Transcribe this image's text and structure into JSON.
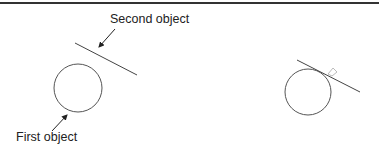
{
  "labels": {
    "second_object": "Second object",
    "first_object": "First object"
  },
  "colors": {
    "stroke": "#555555",
    "border": "#333333",
    "marker": "#bbbbbb"
  }
}
